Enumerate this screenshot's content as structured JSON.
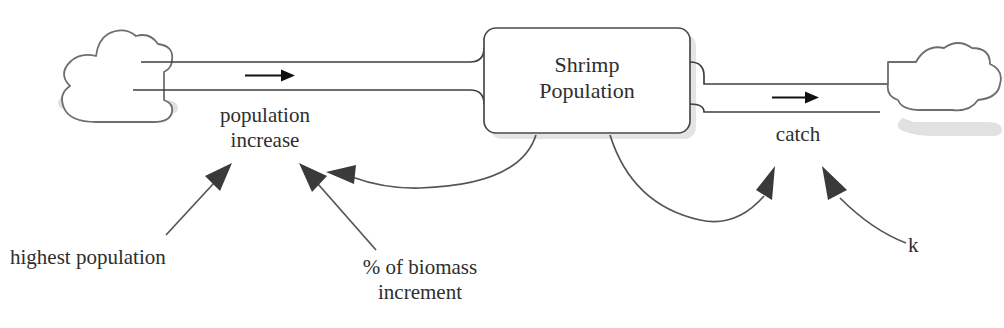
{
  "diagram": {
    "type": "stock-and-flow",
    "stock": {
      "name": "shrimp-population-stock",
      "label": "Shrimp\nPopulation"
    },
    "flows": [
      {
        "name": "population-increase-flow",
        "label": "population\nincrease",
        "direction": "inflow",
        "from": "source-cloud",
        "to": "shrimp-population-stock"
      },
      {
        "name": "catch-flow",
        "label": "catch",
        "direction": "outflow",
        "from": "shrimp-population-stock",
        "to": "sink-cloud"
      }
    ],
    "variables": [
      {
        "name": "highest-population-variable",
        "label": "highest population",
        "influences": "population-increase-flow"
      },
      {
        "name": "biomass-increment-variable",
        "label": "% of biomass\nincrement",
        "influences": "population-increase-flow"
      },
      {
        "name": "k-variable",
        "label": "k",
        "influences": "catch-flow"
      }
    ],
    "feedback_links": [
      {
        "name": "stock-to-population-increase-link",
        "from": "shrimp-population-stock",
        "to": "population-increase-flow"
      },
      {
        "name": "stock-to-catch-link",
        "from": "shrimp-population-stock",
        "to": "catch-flow"
      }
    ],
    "clouds": [
      {
        "name": "source-cloud",
        "role": "source"
      },
      {
        "name": "sink-cloud",
        "role": "sink"
      }
    ],
    "colors": {
      "background": "#ffffff",
      "outline": "#4a4a4a",
      "cloud_outline": "#6e6e6e",
      "arrow": "#3a3a3a",
      "text": "#2e2e2e",
      "shadow": "#c9c9c9"
    }
  }
}
